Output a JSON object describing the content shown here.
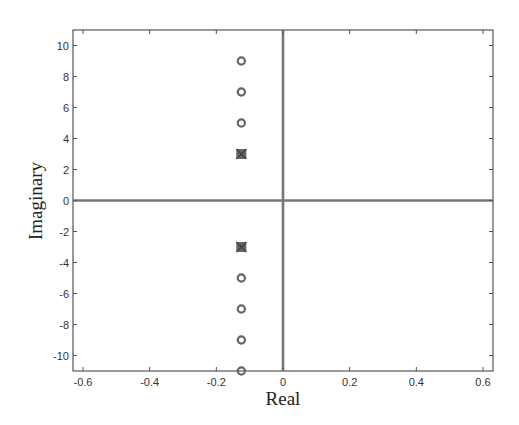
{
  "chart_data": {
    "type": "scatter",
    "title": "",
    "xlabel": "Real",
    "ylabel": "Imaginary",
    "xlim": [
      -0.63,
      0.63
    ],
    "ylim": [
      -11,
      11
    ],
    "grid": false,
    "legend": null,
    "x_ticks": [
      -0.6,
      -0.4,
      -0.2,
      0,
      0.2,
      0.4,
      0.6
    ],
    "x_tick_labels": [
      "-0.6",
      "-0.4",
      "-0.2",
      "0",
      "0.2",
      "0.4",
      "0.6"
    ],
    "y_ticks": [
      10,
      8,
      6,
      4,
      2,
      0,
      -2,
      -4,
      -6,
      -8,
      -10
    ],
    "y_tick_labels": [
      "10",
      "8",
      "6",
      "4",
      "2",
      "0",
      "-2",
      "-4",
      "-6",
      "-8",
      "-10"
    ],
    "zero_lines": true,
    "series": [
      {
        "name": "zeros",
        "marker": "o",
        "points": [
          {
            "x": -0.125,
            "y": 9
          },
          {
            "x": -0.125,
            "y": 7
          },
          {
            "x": -0.125,
            "y": 5
          },
          {
            "x": -0.125,
            "y": 3
          },
          {
            "x": -0.125,
            "y": -3
          },
          {
            "x": -0.125,
            "y": -5
          },
          {
            "x": -0.125,
            "y": -7
          },
          {
            "x": -0.125,
            "y": -9
          },
          {
            "x": -0.125,
            "y": -11
          }
        ]
      },
      {
        "name": "poles",
        "marker": "x",
        "points": [
          {
            "x": -0.125,
            "y": 3
          },
          {
            "x": -0.125,
            "y": -3
          }
        ]
      }
    ]
  },
  "colors": {
    "frame": "#555555",
    "zero_line": "#777777",
    "marker": "#666666"
  }
}
